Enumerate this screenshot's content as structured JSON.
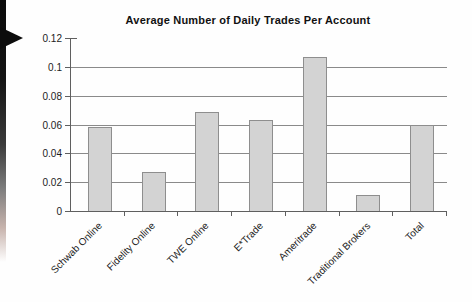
{
  "decorations": {
    "gutter_shadow": "scan-gutter",
    "arrow_color": "#0c0c0c"
  },
  "chart_data": {
    "type": "bar",
    "title": "Average Number of Daily Trades Per Account",
    "categories": [
      "Schwab Online",
      "Fidelity Online",
      "TWE Online",
      "E*Trade",
      "Ameritrade",
      "Traditional Brokers",
      "Total"
    ],
    "values": [
      0.058,
      0.027,
      0.069,
      0.063,
      0.107,
      0.011,
      0.06
    ],
    "xlabel": "",
    "ylabel": "",
    "ylim": [
      0,
      0.12
    ],
    "ytick_step": 0.02,
    "ytick_labels": [
      "0",
      "0.02",
      "0.04",
      "0.06",
      "0.08",
      "0.1",
      "0.12"
    ],
    "grid": true,
    "legend_position": "none",
    "bar_fill": "#d3d3d3",
    "bar_border": "#8e8e8e",
    "grid_color": "#8a8a8a",
    "axis_color": "#5f5f5f"
  }
}
